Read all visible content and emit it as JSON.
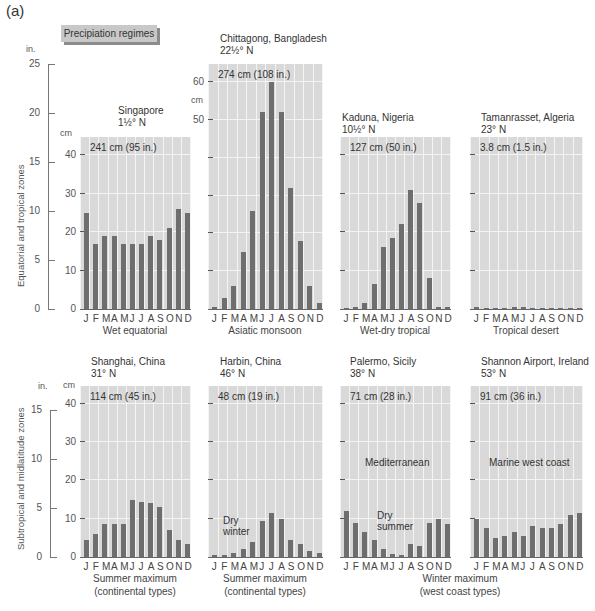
{
  "figure": {
    "label": "(a)",
    "legend_box": "Precipiation regimes",
    "inch_unit": "in.",
    "cm_unit": "cm",
    "rows": [
      {
        "zone_label": "Equatorial and tropical zones",
        "inch_ticks": [
          "25",
          "20",
          "15",
          "10",
          "5",
          "0"
        ]
      },
      {
        "zone_label": "Subtropical and midlatitude zones",
        "inch_ticks": [
          "15",
          "10",
          "5",
          "0"
        ]
      }
    ],
    "top_row_cm_ticks": [
      "40",
      "30",
      "20",
      "10",
      "0"
    ],
    "chittagong_cm_ticks": [
      "60",
      "50"
    ],
    "bottom_row_cm_ticks": [
      "40",
      "30",
      "20",
      "10",
      "0"
    ],
    "months_label": "J F M A M J J A S O N D",
    "annotations": {
      "harbin": "Dry\nwinter",
      "palermo_type": "Mediterranean",
      "palermo_dry": "Dry\nsummer",
      "shannon_type": "Marine west coast"
    },
    "captions": {
      "wet_equatorial": "Wet equatorial",
      "asiatic_monsoon": "Asiatic monsoon",
      "wet_dry_tropical": "Wet-dry tropical",
      "tropical_desert": "Tropical desert",
      "shanghai": "Summer maximum\n(continental types)",
      "harbin": "Summer maximum\n(continental types)",
      "winter_max": "Winter maximum\n(west coast types)"
    }
  },
  "chart_data": [
    {
      "type": "bar",
      "title": "Singapore",
      "subtitle": "1½° N",
      "total": "241 cm (95 in.)",
      "regime": "Wet equatorial",
      "categories": [
        "J",
        "F",
        "M",
        "A",
        "M",
        "J",
        "J",
        "A",
        "S",
        "O",
        "N",
        "D"
      ],
      "values": [
        25,
        17,
        19,
        19,
        17,
        17,
        17,
        19,
        18,
        21,
        26,
        25
      ],
      "ylabel": "cm",
      "ylim": [
        0,
        40
      ]
    },
    {
      "type": "bar",
      "title": "Chittagong, Bangladesh",
      "subtitle": "22½° N",
      "total": "274 cm (108 in.)",
      "regime": "Asiatic monsoon",
      "categories": [
        "J",
        "F",
        "M",
        "A",
        "M",
        "J",
        "J",
        "A",
        "S",
        "O",
        "N",
        "D"
      ],
      "values": [
        0.5,
        3,
        6,
        15,
        26,
        52,
        60,
        52,
        32,
        18,
        6,
        1.5
      ],
      "ylabel": "cm",
      "ylim": [
        0,
        65
      ]
    },
    {
      "type": "bar",
      "title": "Kaduna, Nigeria",
      "subtitle": "10½° N",
      "total": "127 cm (50 in.)",
      "regime": "Wet-dry tropical",
      "categories": [
        "J",
        "F",
        "M",
        "A",
        "M",
        "J",
        "J",
        "A",
        "S",
        "O",
        "N",
        "D"
      ],
      "values": [
        0.3,
        0.5,
        1.5,
        6.5,
        16,
        18.5,
        22,
        31,
        27.5,
        8,
        0.5,
        0.5
      ],
      "ylabel": "cm",
      "ylim": [
        0,
        45
      ]
    },
    {
      "type": "bar",
      "title": "Tamanrasset, Algeria",
      "subtitle": "23° N",
      "total": "3.8 cm (1.5 in.)",
      "regime": "Tropical desert",
      "categories": [
        "J",
        "F",
        "M",
        "A",
        "M",
        "J",
        "J",
        "A",
        "S",
        "O",
        "N",
        "D"
      ],
      "values": [
        0.5,
        0.4,
        0.4,
        0.2,
        0.5,
        0.5,
        0.2,
        0.2,
        0.4,
        0.3,
        0.4,
        0.2
      ],
      "ylabel": "cm",
      "ylim": [
        0,
        45
      ]
    },
    {
      "type": "bar",
      "title": "Shanghai, China",
      "subtitle": "31° N",
      "total": "114 cm (45 in.)",
      "regime": "Summer maximum (continental types)",
      "categories": [
        "J",
        "F",
        "M",
        "A",
        "M",
        "J",
        "J",
        "A",
        "S",
        "O",
        "N",
        "D"
      ],
      "values": [
        4.5,
        6,
        8.5,
        8.5,
        8.5,
        15,
        14.5,
        14,
        13,
        7,
        4.5,
        3.5
      ],
      "ylabel": "cm",
      "ylim": [
        0,
        45
      ]
    },
    {
      "type": "bar",
      "title": "Harbin, China",
      "subtitle": "46° N",
      "total": "48 cm (19 in.)",
      "regime": "Summer maximum (continental types)",
      "categories": [
        "J",
        "F",
        "M",
        "A",
        "M",
        "J",
        "J",
        "A",
        "S",
        "O",
        "N",
        "D"
      ],
      "values": [
        0.5,
        0.5,
        1,
        2,
        4,
        9.5,
        11.5,
        10,
        4.5,
        3.5,
        1.5,
        1
      ],
      "ylabel": "cm",
      "ylim": [
        0,
        45
      ]
    },
    {
      "type": "bar",
      "title": "Palermo, Sicily",
      "subtitle": "38° N",
      "total": "71 cm (28 in.)",
      "regime": "Winter maximum (west coast types) — Mediterranean",
      "categories": [
        "J",
        "F",
        "M",
        "A",
        "M",
        "J",
        "J",
        "A",
        "S",
        "O",
        "N",
        "D"
      ],
      "values": [
        12,
        9,
        6.5,
        4.5,
        2,
        0.7,
        0.5,
        3.5,
        3,
        9,
        10,
        8.5
      ],
      "ylabel": "cm",
      "ylim": [
        0,
        45
      ]
    },
    {
      "type": "bar",
      "title": "Shannon Airport, Ireland",
      "subtitle": "53° N",
      "total": "91 cm (36 in.)",
      "regime": "Winter maximum (west coast types) — Marine west coast",
      "categories": [
        "J",
        "F",
        "M",
        "A",
        "M",
        "J",
        "J",
        "A",
        "S",
        "O",
        "N",
        "D"
      ],
      "values": [
        10,
        7.5,
        5,
        5.5,
        6.5,
        5.5,
        8,
        7.5,
        7.5,
        8.5,
        11,
        11.5
      ],
      "ylabel": "cm",
      "ylim": [
        0,
        45
      ]
    }
  ]
}
